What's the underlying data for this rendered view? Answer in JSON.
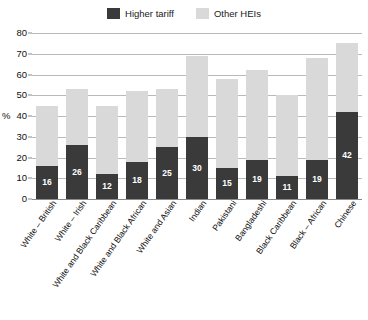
{
  "legend": {
    "items": [
      {
        "label": "Higher tariff",
        "color": "#3a3a3a",
        "swatch_name": "legend-swatch-higher-tariff"
      },
      {
        "label": "Other HEIs",
        "color": "#d9d9d9",
        "swatch_name": "legend-swatch-other-heis"
      }
    ]
  },
  "axis": {
    "y_title": "%",
    "y_ticks": [
      "0",
      "10",
      "20",
      "30",
      "40",
      "50",
      "60",
      "70",
      "80"
    ]
  },
  "chart_data": {
    "type": "bar",
    "title": "",
    "subtitle": "",
    "xlabel": "",
    "ylabel": "%",
    "ylim": [
      0,
      80
    ],
    "ytick_step": 10,
    "grid": true,
    "stacked": true,
    "legend_position": "top-center",
    "orientation": "vertical",
    "categories": [
      "White – British",
      "White – Irish",
      "White and Black Caribbean",
      "White and Black African",
      "White and Asian",
      "Indian",
      "Pakistani",
      "Bangladeshi",
      "Black Caribbean",
      "Black – African",
      "Chinese"
    ],
    "series": [
      {
        "name": "Higher tariff",
        "color": "#3a3a3a",
        "values": [
          16,
          26,
          12,
          18,
          25,
          30,
          15,
          19,
          11,
          19,
          42
        ],
        "labels": [
          "16",
          "26",
          "12",
          "18",
          "25",
          "30",
          "15",
          "19",
          "11",
          "19",
          "42"
        ]
      },
      {
        "name": "Other HEIs",
        "color": "#d9d9d9",
        "values": [
          29,
          27,
          33,
          34,
          28,
          39,
          43,
          43,
          39,
          49,
          33
        ],
        "labels": [
          "",
          "",
          "",
          "",
          "",
          "",
          "",
          "",
          "",
          "",
          ""
        ]
      }
    ],
    "totals": [
      45,
      53,
      45,
      52,
      53,
      69,
      58,
      62,
      50,
      68,
      75
    ]
  }
}
